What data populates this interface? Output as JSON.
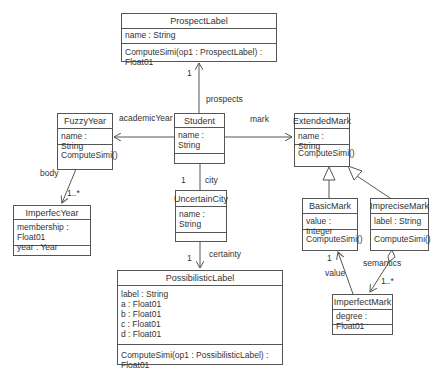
{
  "classes": {
    "prospect_label": {
      "name": "ProspectLabel",
      "attrs": [
        "name : String"
      ],
      "ops": [
        "ComputeSimi(op1 : ProspectLabel) : Float01"
      ]
    },
    "fuzzy_year": {
      "name": "FuzzyYear",
      "attrs": [
        "name : String"
      ],
      "ops": [
        "ComputeSimi()"
      ]
    },
    "student": {
      "name": "Student",
      "attrs": [
        "name : String"
      ],
      "ops": []
    },
    "extended_mark": {
      "name": "ExtendedMark",
      "attrs": [
        "name : String"
      ],
      "ops": [
        "ComputeSimi()"
      ]
    },
    "imperfec_year": {
      "name": "ImperfecYear",
      "attrs": [
        "membership : Float01",
        "year : Year"
      ],
      "ops": []
    },
    "uncertain_city": {
      "name": "UncertainCity",
      "attrs": [
        "name : String"
      ],
      "ops": []
    },
    "basic_mark": {
      "name": "BasicMark",
      "attrs": [
        "value : Integer"
      ],
      "ops": [
        "ComputeSimi()"
      ]
    },
    "imprecise_mark": {
      "name": "ImpreciseMark",
      "attrs": [
        "label : String"
      ],
      "ops": [
        "ComputeSimi()"
      ]
    },
    "possibilistic_label": {
      "name": "PossibilisticLabel",
      "attrs": [
        "label : String",
        "a : Float01",
        "b : Float01",
        "c : Float01",
        "d : Float01"
      ],
      "ops": [
        "ComputeSimi(op1 : PossibilisticLabel) : Float01"
      ]
    },
    "imperfect_mark": {
      "name": "ImperfectMark",
      "attrs": [
        "degree : Float01"
      ],
      "ops": []
    }
  },
  "associations": {
    "prospects": {
      "role": "prospects",
      "mult": "1"
    },
    "academic_year": {
      "role": "academicYear"
    },
    "mark": {
      "role": "mark"
    },
    "body": {
      "role": "body",
      "mult": "1..*"
    },
    "city": {
      "role": "city",
      "mult": "1"
    },
    "certainty": {
      "role": "certainty",
      "mult": "1"
    },
    "value": {
      "role": "value",
      "mult": "1"
    },
    "semantics": {
      "role": "semantics",
      "mult": "1..*"
    }
  },
  "colors": {
    "line": "#555555",
    "text": "#333333",
    "background": "#ffffff"
  }
}
